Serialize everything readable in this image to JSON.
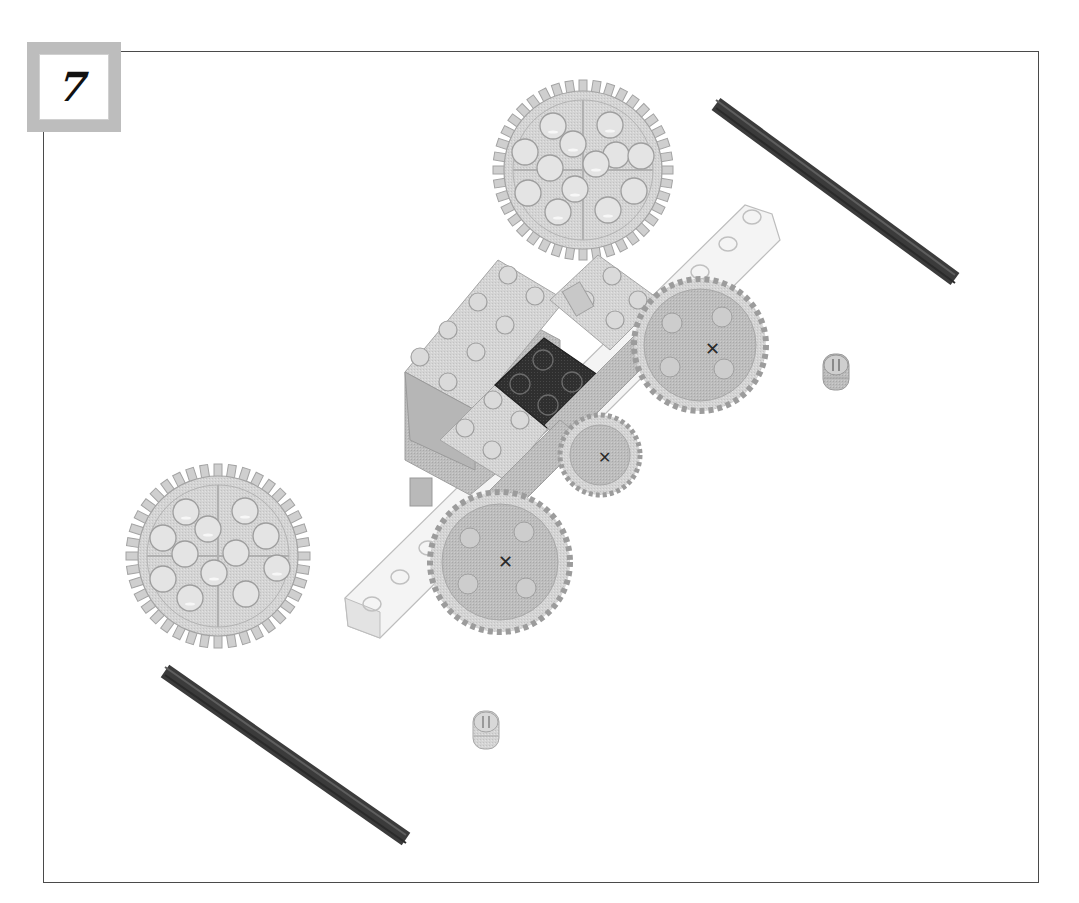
{
  "page": {
    "type": "building-instruction-step",
    "step": {
      "number": "7"
    }
  },
  "colors": {
    "frame": "#4a4a4a",
    "badge_border": "#bdbdbd",
    "part_light": "#d9d9d9",
    "part_mid": "#bcbcbc",
    "part_shadow": "#9a9a9a",
    "axle": "#3f3f3f",
    "plate_dark": "#2e2e2e"
  },
  "parts": [
    {
      "name": "gear-40-tooth",
      "label": "40-tooth gear",
      "count": 2
    },
    {
      "name": "axle",
      "label": "Cross axle",
      "count": 2
    },
    {
      "name": "bushing",
      "label": "Bushing",
      "count": 2
    },
    {
      "name": "assembly",
      "label": "Gear train sub-assembly",
      "count": 1
    }
  ]
}
